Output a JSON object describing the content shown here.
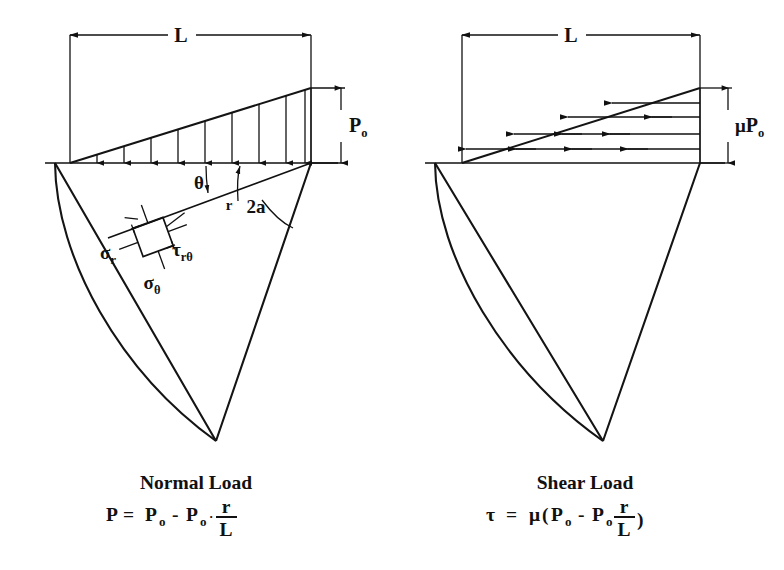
{
  "figure": {
    "background_color": "#ffffff",
    "line_color": "#111111",
    "panels": [
      {
        "id": "left",
        "caption_title": "Normal Load",
        "equation_plain": "P = P_o - P_o · r/L",
        "equation_parts": {
          "lhs": "P",
          "equals": "=",
          "term1_base": "P",
          "term1_sub": "o",
          "minus": "-",
          "term2_base": "P",
          "term2_sub": "o",
          "dot": "·",
          "frac_num": "r",
          "frac_den": "L"
        },
        "dimension_labels": {
          "span": "L",
          "magnitude_base": "P",
          "magnitude_sub": "o"
        },
        "annotations": [
          {
            "name": "theta",
            "text": "θ"
          },
          {
            "name": "radius",
            "text": "r"
          },
          {
            "name": "wedge-angle",
            "text": "2a"
          }
        ],
        "stress_element_labels": [
          {
            "name": "sigma-r",
            "base": "σ",
            "sub": "r"
          },
          {
            "name": "tau-r-theta",
            "base": "τ",
            "sub": "rθ"
          },
          {
            "name": "sigma-theta",
            "base": "σ",
            "sub": "θ"
          }
        ],
        "load_arrow_count": 9,
        "load_direction": "down"
      },
      {
        "id": "right",
        "caption_title": "Shear Load",
        "equation_plain": "τ = μ(P_o - P_o r/L)",
        "equation_parts": {
          "lhs": "τ",
          "equals": "=",
          "mu": "μ",
          "open_paren": "(",
          "term1_base": "P",
          "term1_sub": "o",
          "minus": "-",
          "term2_base": "P",
          "term2_sub": "o",
          "frac_num": "r",
          "frac_den": "L",
          "close_paren": ")"
        },
        "dimension_labels": {
          "span": "L",
          "magnitude_mu": "μ",
          "magnitude_base": "P",
          "magnitude_sub": "o"
        },
        "load_arrow_rows": 4,
        "load_direction": "left"
      }
    ]
  }
}
